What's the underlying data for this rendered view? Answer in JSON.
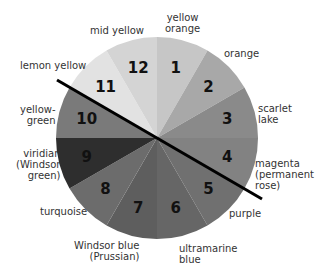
{
  "diagram": {
    "type": "color-wheel",
    "center": [
      157,
      138
    ],
    "radius": 101,
    "divider_line": {
      "from": [
        57,
        80
      ],
      "to": [
        262,
        199
      ],
      "color": "#000000"
    },
    "segments": [
      {
        "number": "1",
        "name": "yellow orange",
        "fill": "#c6c6c6",
        "start": -90,
        "end": -60
      },
      {
        "number": "2",
        "name": "orange",
        "fill": "#a8a8a8",
        "start": -60,
        "end": -30
      },
      {
        "number": "3",
        "name": "scarlet lake",
        "fill": "#8a8a8a",
        "start": -30,
        "end": 0
      },
      {
        "number": "4",
        "name": "magenta (permanent rose)",
        "fill": "#828282",
        "start": 0,
        "end": 30
      },
      {
        "number": "5",
        "name": "purple",
        "fill": "#707070",
        "start": 30,
        "end": 60
      },
      {
        "number": "6",
        "name": "ultramarine blue",
        "fill": "#666666",
        "start": 60,
        "end": 90
      },
      {
        "number": "7",
        "name": "Windsor blue (Prussian)",
        "fill": "#5e5e5e",
        "start": 90,
        "end": 120
      },
      {
        "number": "8",
        "name": "turquoise",
        "fill": "#6c6c6c",
        "start": 120,
        "end": 150
      },
      {
        "number": "9",
        "name": "viridian (Windsor green)",
        "fill": "#2e2e2e",
        "start": 150,
        "end": 180
      },
      {
        "number": "10",
        "name": "yellow-green",
        "fill": "#7a7a7a",
        "start": 180,
        "end": 210
      },
      {
        "number": "11",
        "name": "lemon yellow",
        "fill": "#e2e2e2",
        "start": 210,
        "end": 240
      },
      {
        "number": "12",
        "name": "mid yellow",
        "fill": "#d4d4d4",
        "start": 240,
        "end": 270
      }
    ]
  },
  "labels": {
    "yellow_orange": [
      "yellow",
      "orange"
    ],
    "orange": "orange",
    "scarlet_lake": [
      "scarlet",
      "lake"
    ],
    "magenta": [
      "magenta",
      "(permanent",
      "rose)"
    ],
    "purple": "purple",
    "ultramarine": [
      "ultramarine",
      "blue"
    ],
    "windsor_blue": [
      "Windsor blue",
      "(Prussian)"
    ],
    "turquoise": "turquoise",
    "viridian": [
      "viridian",
      "(Windsor",
      "green)"
    ],
    "yellow_green": [
      "yellow-",
      "green"
    ],
    "lemon_yellow": "lemon yellow",
    "mid_yellow": "mid yellow"
  }
}
